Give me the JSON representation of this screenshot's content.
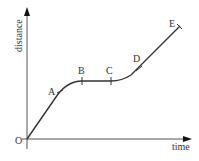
{
  "diagram": {
    "axes": {
      "x_label": "time",
      "y_label": "distance",
      "origin_label": "O"
    },
    "points": [
      {
        "label": "A",
        "segment_note": "end of accelerating section"
      },
      {
        "label": "B",
        "segment_note": "start of constant distance"
      },
      {
        "label": "C",
        "segment_note": "end of constant distance"
      },
      {
        "label": "D",
        "segment_note": "start of constant speed"
      },
      {
        "label": "E",
        "segment_note": "end"
      }
    ],
    "colors": {
      "line": "#333333",
      "axis": "#555555",
      "text": "#333333"
    }
  }
}
